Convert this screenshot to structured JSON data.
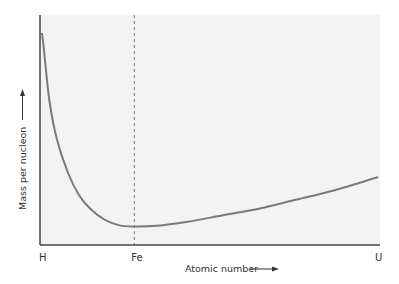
{
  "chart_data": {
    "type": "line",
    "title": "",
    "xlabel": "Atomic number",
    "ylabel": "Mass per nucleon",
    "x_ticks": [
      "H",
      "Fe",
      "U"
    ],
    "x_tick_positions": [
      1,
      26,
      92
    ],
    "xlim": [
      1,
      92
    ],
    "ylim": [
      0,
      1
    ],
    "grid": false,
    "legend": "none",
    "reference_line": {
      "x": 26,
      "label": "Fe",
      "style": "dashed"
    },
    "series": [
      {
        "name": "Mass per nucleon",
        "x": [
          1,
          1.5,
          3,
          5,
          8,
          11,
          14,
          18,
          22,
          26,
          32,
          40,
          50,
          60,
          70,
          80,
          92
        ],
        "y": [
          0.92,
          0.85,
          0.62,
          0.45,
          0.3,
          0.2,
          0.14,
          0.09,
          0.065,
          0.06,
          0.063,
          0.08,
          0.11,
          0.14,
          0.18,
          0.22,
          0.28
        ]
      }
    ],
    "colors": {
      "line": "#7a7a7a",
      "axis": "#444444",
      "background": "#f3f3f3",
      "reference": "#777777"
    }
  }
}
